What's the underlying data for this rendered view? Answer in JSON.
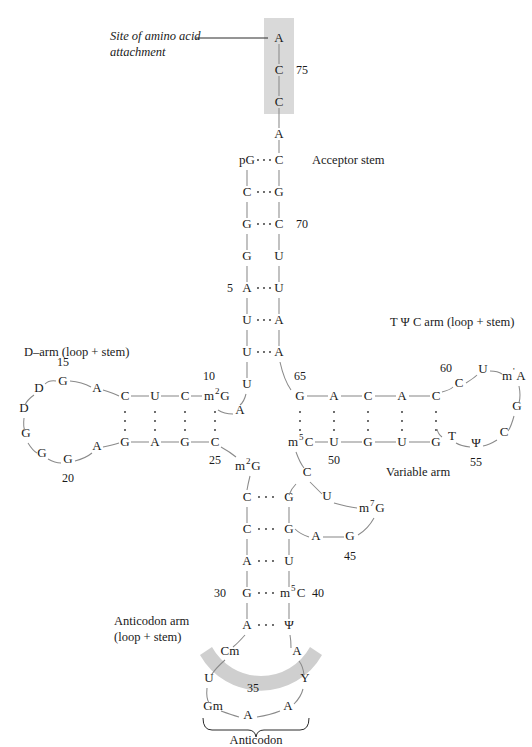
{
  "figure": {
    "labels": {
      "amino_acid_site_line1": "Site of amino acid",
      "amino_acid_site_line2": "attachment",
      "acceptor_stem": "Acceptor stem",
      "d_arm": "D–arm (loop + stem)",
      "tpsic_arm": "T Ψ C arm (loop  + stem)",
      "variable_arm": "Variable arm",
      "anticodon_arm_line1": "Anticodon arm",
      "anticodon_arm_line2": "(loop + stem)",
      "anticodon": "Anticodon"
    },
    "colors": {
      "highlight_gray": "#d9d9d9",
      "arc_gray": "#cfcfcf",
      "bond_gray": "#8a8a8a",
      "text_black": "#1a1a1a"
    },
    "position_numbers": [
      "5",
      "10",
      "15",
      "20",
      "25",
      "30",
      "35",
      "40",
      "45",
      "50",
      "55",
      "60",
      "65",
      "70",
      "75"
    ],
    "acceptor_stem": {
      "single_strand_3prime": [
        "A",
        "C",
        "C",
        "A"
      ],
      "left_strand": [
        "pG",
        "C",
        "G",
        "G",
        "A",
        "U",
        "U"
      ],
      "right_strand": [
        "C",
        "G",
        "C",
        "U",
        "U",
        "A",
        "A"
      ],
      "pairing": [
        "paired",
        "paired",
        "paired",
        "unpaired",
        "paired",
        "paired",
        "paired"
      ]
    },
    "d_arm": {
      "loop": [
        "G",
        "D",
        "D",
        "G",
        "G",
        "G",
        "A",
        "A"
      ],
      "top_strand": [
        "C",
        "U",
        "C",
        "m2G"
      ],
      "bottom_strand": [
        "G",
        "A",
        "G",
        "C"
      ],
      "junction_left": [
        "U",
        "A"
      ],
      "junction_right": [
        "m2G"
      ]
    },
    "tpsic_arm": {
      "top_strand": [
        "G",
        "A",
        "C",
        "A",
        "C"
      ],
      "bottom_strand": [
        "m5C",
        "U",
        "G",
        "U",
        "G"
      ],
      "loop": [
        "C",
        "U",
        "m1A",
        "G",
        "C",
        "Ψ",
        "T"
      ]
    },
    "variable_arm": {
      "bases": [
        "C",
        "U",
        "m7G",
        "G",
        "A"
      ]
    },
    "anticodon_arm": {
      "left_strand": [
        "C",
        "C",
        "A",
        "G",
        "A"
      ],
      "right_strand": [
        "G",
        "G",
        "U",
        "m5C",
        "Ψ"
      ],
      "loop": [
        "Cm",
        "U",
        "Gm",
        "A",
        "A",
        "Y",
        "A"
      ],
      "anticodon_bases": [
        "Gm",
        "A",
        "A"
      ]
    },
    "modified_bases": [
      {
        "symbol": "m2G",
        "base": "m",
        "sup": "2",
        "tail": "G"
      },
      {
        "symbol": "m5C",
        "base": "m",
        "sup": "5",
        "tail": "C"
      },
      {
        "symbol": "m7G",
        "base": "m",
        "sup": "7",
        "tail": "G"
      },
      {
        "symbol": "m1A",
        "base": "m",
        "sup": "'",
        "tail": "A"
      }
    ]
  }
}
